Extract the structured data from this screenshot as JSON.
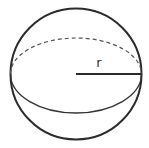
{
  "diagram": {
    "type": "geometry",
    "shape": "sphere",
    "labels": {
      "radius": "r"
    },
    "colors": {
      "stroke": "#2b2b2b",
      "background": "#ffffff"
    },
    "elements": [
      {
        "kind": "outline-circle",
        "cx": 76,
        "cy": 74,
        "r": 66
      },
      {
        "kind": "equator-front-arc",
        "style": "solid"
      },
      {
        "kind": "equator-back-arc",
        "style": "dashed"
      },
      {
        "kind": "radius-line",
        "from": [
          76,
          74
        ],
        "to": [
          142,
          74
        ]
      }
    ]
  }
}
